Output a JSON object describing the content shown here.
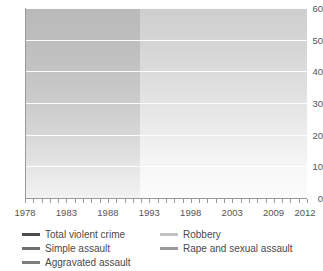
{
  "chart_data": {
    "type": "line",
    "title": "",
    "subtitle": "",
    "xlabel": "",
    "ylabel": "",
    "xlim": [
      1978,
      2012
    ],
    "ylim": [
      0,
      60
    ],
    "ytick_labels": [
      "0",
      "10",
      "20",
      "30",
      "40",
      "50",
      "60"
    ],
    "yticks": [
      0,
      10,
      20,
      30,
      40,
      50,
      60
    ],
    "xtick_labels": [
      "1978",
      "1983",
      "1988",
      "1993",
      "1998",
      "2003",
      "2009",
      "2012"
    ],
    "xticks": [
      1978,
      1983,
      1988,
      1993,
      1998,
      2003,
      2009,
      2012
    ],
    "grid": "horizontal-white",
    "legend_position": "below",
    "x": [
      1978,
      1979,
      1980,
      1981,
      1982,
      1983,
      1984,
      1985,
      1986,
      1987,
      1988,
      1989,
      1990,
      1991,
      1992,
      1993,
      1994,
      1995,
      1996,
      1997,
      1998,
      1999,
      2000,
      2001,
      2002,
      2003,
      2004,
      2005,
      2008,
      2009,
      2010,
      2011
    ],
    "series": [
      {
        "name": "Total violent crime",
        "color": "#4d4d4d",
        "values": [
          50.9,
          51.3,
          49.6,
          52.3,
          50.7,
          46.6,
          46.4,
          45.2,
          42.0,
          44.0,
          44.1,
          43.3,
          44.1,
          48.8,
          47.9,
          49.9,
          51.8,
          46.1,
          41.6,
          38.8,
          36.0,
          32.1,
          27.4,
          24.7,
          22.8,
          22.3,
          21.1,
          21.2,
          21.5,
          20.8,
          20.5,
          20.6
        ],
        "dash_gap": [
          2005,
          2008
        ]
      },
      {
        "name": "Simple assault",
        "color": "#707070",
        "values": [
          30.2,
          29.9,
          28.3,
          29.9,
          29.1,
          28.1,
          27.9,
          27.8,
          25.6,
          26.4,
          26.1,
          26.2,
          26.6,
          30.0,
          28.9,
          30.0,
          31.6,
          28.7,
          26.3,
          24.5,
          22.8,
          20.8,
          18.0,
          16.5,
          15.3,
          14.6,
          13.7,
          13.5,
          13.1,
          12.9,
          12.8,
          13.0
        ],
        "dash_gap": [
          2005,
          2008
        ]
      },
      {
        "name": "Aggravated assault",
        "color": "#7d7d7d",
        "values": [
          11.9,
          11.1,
          11.5,
          11.0,
          10.5,
          10.4,
          10.6,
          10.2,
          10.1,
          10.1,
          10.4,
          10.2,
          10.2,
          10.5,
          10.6,
          11.8,
          11.8,
          10.1,
          8.8,
          8.5,
          7.5,
          6.6,
          5.7,
          5.3,
          4.9,
          4.6,
          4.3,
          4.3,
          4.3,
          4.2,
          4.1,
          4.1
        ],
        "dash_gap": [
          2005,
          2008
        ]
      },
      {
        "name": "Robbery",
        "color": "#c2c2c2",
        "values": [
          5.9,
          6.3,
          6.6,
          7.4,
          7.1,
          6.0,
          5.8,
          5.1,
          5.1,
          5.3,
          5.3,
          5.4,
          5.7,
          5.9,
          6.1,
          6.0,
          6.3,
          5.4,
          5.2,
          4.3,
          4.0,
          3.6,
          3.2,
          2.8,
          2.7,
          2.5,
          2.1,
          2.6,
          2.2,
          2.1,
          2.0,
          2.2
        ],
        "dash_gap": [
          2005,
          2008
        ]
      },
      {
        "name": "Rape and sexual assault",
        "color": "#9a9a9a",
        "values": [
          2.9,
          2.8,
          2.6,
          2.6,
          2.5,
          2.2,
          2.5,
          2.1,
          2.0,
          2.1,
          2.2,
          2.1,
          2.2,
          2.2,
          2.5,
          2.6,
          2.7,
          2.1,
          1.8,
          1.6,
          1.5,
          1.3,
          1.2,
          1.1,
          1.1,
          1.0,
          0.9,
          1.0,
          0.8,
          0.8,
          0.7,
          0.9
        ]
      }
    ],
    "shaded_region": {
      "from": 1978,
      "to": 1992,
      "note": "darker background band"
    }
  },
  "legend": {
    "items": [
      {
        "label": "Total violent crime",
        "color": "#4d4d4d"
      },
      {
        "label": "Simple assault",
        "color": "#707070"
      },
      {
        "label": "Aggravated assault",
        "color": "#7d7d7d"
      },
      {
        "label": "Robbery",
        "color": "#c2c2c2"
      },
      {
        "label": "Rape and sexual assault",
        "color": "#9a9a9a"
      }
    ]
  },
  "axes": {
    "y": {
      "labels": [
        "60",
        "50",
        "40",
        "30",
        "20",
        "10",
        "0"
      ]
    },
    "x": {
      "labels": [
        "1978",
        "1983",
        "1988",
        "1993",
        "1998",
        "2003",
        "2009",
        "2012"
      ]
    }
  }
}
